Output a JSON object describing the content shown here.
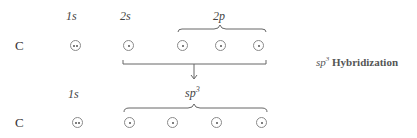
{
  "diagram": {
    "title_prefix": "sp",
    "title_sup": "3",
    "title_suffix": "Hybridization",
    "ground_state": {
      "element": "C",
      "labels": [
        "1s",
        "2s",
        "2p"
      ],
      "orbitals": [
        {
          "name": "1s",
          "electrons": 2
        },
        {
          "name": "2s",
          "electrons": 1
        },
        {
          "name": "2p",
          "electrons": 1
        },
        {
          "name": "2p",
          "electrons": 1
        },
        {
          "name": "2p",
          "electrons": 1
        }
      ]
    },
    "hybridized_state": {
      "element": "C",
      "label_1s": "1s",
      "label_hybrid": "sp",
      "label_hybrid_sup": "3",
      "orbitals": [
        {
          "name": "1s",
          "electrons": 2
        },
        {
          "name": "sp3",
          "electrons": 1
        },
        {
          "name": "sp3",
          "electrons": 1
        },
        {
          "name": "sp3",
          "electrons": 1
        },
        {
          "name": "sp3",
          "electrons": 1
        }
      ]
    }
  }
}
